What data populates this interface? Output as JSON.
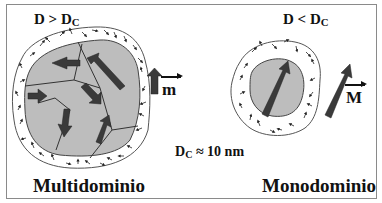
{
  "labels": {
    "left_condition": {
      "main": "D > D",
      "sub": "C"
    },
    "right_condition": {
      "main": "D < D",
      "sub": "C"
    },
    "critical_diameter": {
      "main": "D",
      "sub": "C",
      "rest": " ≈ 10 nm"
    },
    "left_caption": "Multidominio",
    "right_caption": "Monodominio",
    "vector_m": "m",
    "vector_M": "M"
  },
  "colors": {
    "particle_fill": "#bdbdbd",
    "arrow_dark": "#3a3a3a",
    "outline": "#555555",
    "frame": "#8a8a8a"
  },
  "particles": [
    {
      "name": "multidomain-particle",
      "domains": 6,
      "surface_spins": "disordered"
    },
    {
      "name": "monodomain-particle",
      "domains": 1,
      "surface_spins": "disordered"
    }
  ]
}
